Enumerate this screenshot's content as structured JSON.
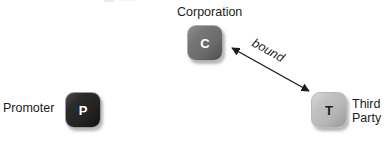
{
  "diagram": {
    "background_color": "#ffffff",
    "nodes": [
      {
        "id": "promoter",
        "glyph": "P",
        "label": "Promoter",
        "label_position": "left",
        "fill_color": "#2a2a2a",
        "glyph_color": "#ffffff",
        "x": 65,
        "y": 92
      },
      {
        "id": "corporation",
        "glyph": "C",
        "label": "Corporation",
        "label_position": "above",
        "fill_color": "#6e6e6e",
        "glyph_color": "#ffffff",
        "x": 187,
        "y": 25
      },
      {
        "id": "third-party",
        "glyph": "T",
        "label": "Third\nParty",
        "label_position": "right",
        "fill_color": "#b8b8b8",
        "glyph_color": "#1b1b1b",
        "x": 311,
        "y": 92
      }
    ],
    "edges": [
      {
        "id": "bound",
        "label": "bound",
        "from": "corporation",
        "to": "third-party",
        "arrowheads": "both",
        "color": "#1c1c1c",
        "x1": 229,
        "y1": 46,
        "x2": 312,
        "y2": 93
      }
    ]
  }
}
